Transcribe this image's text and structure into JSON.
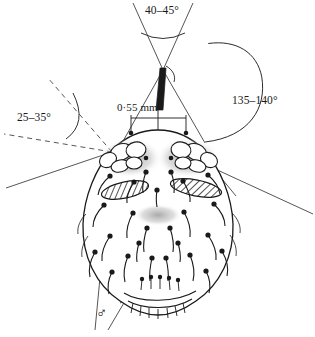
{
  "figure": {
    "type": "scientific-line-drawing",
    "sex_symbol": "♂"
  },
  "annotations": {
    "apex_angle": "40–45°",
    "left_angle": "25–35°",
    "right_angle": "135–140°",
    "width_measure": "0·55 mm"
  },
  "colors": {
    "ink": "#1a1a1a",
    "paper": "#ffffff",
    "stipple": "#8d8d8d",
    "guide": "#3a3a3a"
  }
}
